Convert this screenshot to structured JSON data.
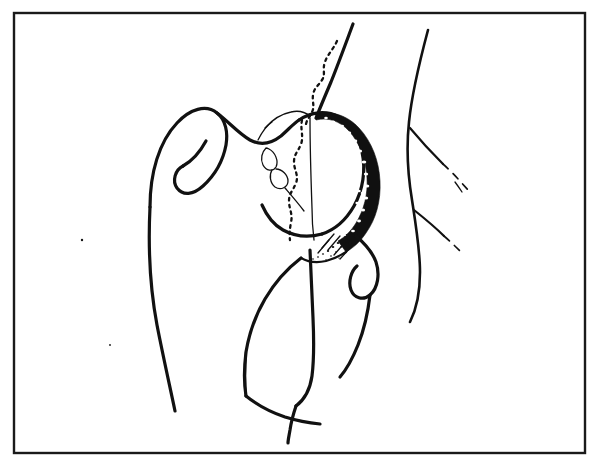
{
  "figure": {
    "title": "Hip joint line drawing",
    "type": "anatomical-line-illustration",
    "view": "anteroposterior hip",
    "background_color": "#ffffff",
    "ink_color": "#111111",
    "frame": {
      "present": true,
      "color": "#1a1a1a",
      "stroke_width": 2.4,
      "x": 14,
      "y": 13,
      "width": 571,
      "height": 440
    },
    "canvas": {
      "width": 598,
      "height": 466
    },
    "labels": [],
    "text_annotations": [],
    "structures": [
      {
        "name": "greater-trochanter",
        "style": "solid-outline"
      },
      {
        "name": "femoral-neck",
        "style": "solid-outline"
      },
      {
        "name": "femoral-head",
        "style": "solid-outline"
      },
      {
        "name": "femoral-shaft-lateral-cortex",
        "style": "solid-outline"
      },
      {
        "name": "femoral-shaft-medial-cortex",
        "style": "solid-outline"
      },
      {
        "name": "acetabular-roof-sclerotic-band",
        "style": "filled-stippled-crescent"
      },
      {
        "name": "pelvic-ilium-line",
        "style": "solid-outline"
      },
      {
        "name": "pelvic-inner-wavy-dotted-line",
        "style": "dotted-wavy"
      },
      {
        "name": "femoral-head-dotted-margin",
        "style": "dotted-wavy"
      },
      {
        "name": "fovea-capitis-leaf-marking",
        "style": "fine-outline"
      },
      {
        "name": "obturator-foramen",
        "style": "solid-outline"
      },
      {
        "name": "superior-pubic-ramus",
        "style": "solid-outline"
      },
      {
        "name": "inferior-pubic-ramus",
        "style": "solid-outline"
      },
      {
        "name": "soft-tissue-body-contour",
        "style": "solid-outline"
      },
      {
        "name": "soft-tissue-crease-branches",
        "style": "solid-to-dashed"
      },
      {
        "name": "lesser-trochanter-loop",
        "style": "solid-outline"
      }
    ],
    "stroke_widths": {
      "frame": 2.4,
      "bone_outline": 3.2,
      "bone_outline_thin": 2.2,
      "bone_fine": 1.3,
      "soft_tissue": 2.6,
      "dotted_wavy": 2.3,
      "dashed_lead": 1.7
    }
  }
}
